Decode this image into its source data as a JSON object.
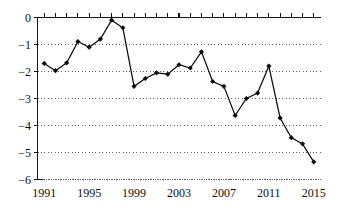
{
  "chart_data": {
    "type": "line",
    "title": "",
    "subtitle": "",
    "xlabel": "",
    "ylabel": "",
    "x": [
      1991,
      1992,
      1993,
      1994,
      1995,
      1996,
      1997,
      1998,
      1999,
      2000,
      2001,
      2002,
      2003,
      2004,
      2005,
      2006,
      2007,
      2008,
      2009,
      2010,
      2011,
      2012,
      2013,
      2014,
      2015
    ],
    "values": [
      -1.7,
      -1.97,
      -1.68,
      -0.89,
      -1.1,
      -0.8,
      -0.1,
      -0.38,
      -2.55,
      -2.26,
      -2.05,
      -2.1,
      -1.75,
      -1.87,
      -1.27,
      -2.37,
      -2.55,
      -3.63,
      -3.0,
      -2.8,
      -1.8,
      -3.72,
      -4.45,
      -4.68,
      -5.35
    ],
    "series": [
      {
        "name": "series-1",
        "values": [
          -1.7,
          -1.97,
          -1.68,
          -0.89,
          -1.1,
          -0.8,
          -0.1,
          -0.38,
          -2.55,
          -2.26,
          -2.05,
          -2.1,
          -1.75,
          -1.87,
          -1.27,
          -2.37,
          -2.55,
          -3.63,
          -3.0,
          -2.8,
          -1.8,
          -3.72,
          -4.45,
          -4.68,
          -5.35
        ],
        "color": "#0d0d0d",
        "marker": "diamond"
      }
    ],
    "xlim": [
      1990.4,
      2015.6
    ],
    "ylim": [
      -6,
      0
    ],
    "xticks": [
      1991,
      1992,
      1993,
      1994,
      1995,
      1996,
      1997,
      1998,
      1999,
      2000,
      2001,
      2002,
      2003,
      2004,
      2005,
      2006,
      2007,
      2008,
      2009,
      2010,
      2011,
      2012,
      2013,
      2014,
      2015
    ],
    "xtick_labels_shown": [
      "1991",
      "1995",
      "1999",
      "2003",
      "2007",
      "2011",
      "2015"
    ],
    "xtick_labels_shown_values": [
      1991,
      1995,
      1999,
      2003,
      2007,
      2011,
      2015
    ],
    "yticks": [
      0,
      -1,
      -2,
      -3,
      -4,
      -5,
      -6
    ],
    "ytick_labels": [
      "0",
      "−1",
      "−2",
      "−3",
      "−4",
      "−5",
      "−6"
    ],
    "grid": true,
    "grid_axis": "y",
    "grid_style": "dotted",
    "legend": null,
    "legend_position": "none",
    "axis_color": "#151515",
    "grid_color": "#4a4a4a",
    "background_color": "#ffffff"
  },
  "axes": {
    "y_axis_name": "y-axis",
    "x_axis_name": "x-axis",
    "top_axis_name": "top-axis"
  }
}
